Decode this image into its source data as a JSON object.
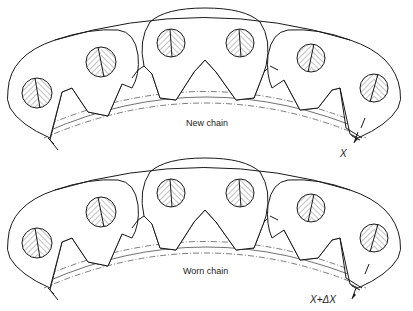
{
  "figure": {
    "panels": [
      {
        "id": "new",
        "label": "New chain",
        "dimension_label": "X"
      },
      {
        "id": "worn",
        "label": "Worn chain",
        "dimension_label": "X+ΔX"
      }
    ]
  }
}
